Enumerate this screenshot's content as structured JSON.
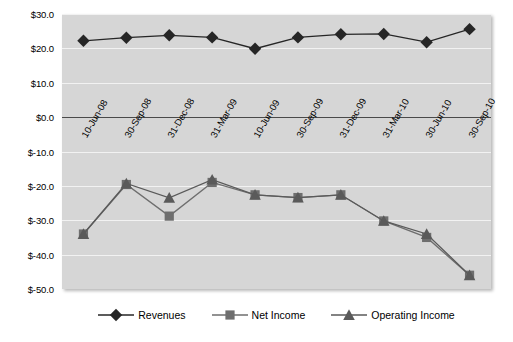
{
  "chart_data": {
    "type": "line",
    "title": "",
    "subtitle": "",
    "xlabel": "",
    "ylabel": "",
    "categories": [
      "10-Jun-08",
      "30-Sep-08",
      "31-Dec-08",
      "31-Mar-09",
      "10-Jun-09",
      "30-Sep-09",
      "31-Dec-09",
      "31-Mar-10",
      "30-Jun-10",
      "30-Sep-10"
    ],
    "ylim": [
      -50.0,
      30.0
    ],
    "ytick_labels": [
      "$30.0",
      "$20.0",
      "$10.0",
      "$0.0",
      "$-10.0",
      "$-20.0",
      "$-30.0",
      "$-40.0",
      "$-50.0"
    ],
    "ytick_values": [
      30,
      20,
      10,
      0,
      -10,
      -20,
      -30,
      -40,
      -50
    ],
    "grid": true,
    "legend_position": "bottom",
    "currency_prefix": "$",
    "series": [
      {
        "name": "Revenues",
        "marker": "diamond",
        "color": "#262626",
        "values": [
          22.2,
          23.1,
          23.8,
          23.2,
          19.9,
          23.2,
          24.1,
          24.2,
          21.8,
          25.6
        ]
      },
      {
        "name": "Net Income",
        "marker": "square",
        "color": "#6e6e6e",
        "values": [
          -34.0,
          -19.6,
          -28.8,
          -19.0,
          -22.6,
          -23.4,
          -22.6,
          -30.2,
          -35.0,
          -46.0
        ]
      },
      {
        "name": "Operating Income",
        "marker": "triangle",
        "color": "#5a5a5a",
        "values": [
          -34.0,
          -19.3,
          -23.5,
          -18.2,
          -22.6,
          -23.4,
          -22.6,
          -30.2,
          -34.0,
          -46.0
        ]
      }
    ]
  },
  "legend": {
    "items": [
      {
        "label": "Revenues",
        "icon": "diamond-marker-icon"
      },
      {
        "label": "Net Income",
        "icon": "square-marker-icon"
      },
      {
        "label": "Operating Income",
        "icon": "triangle-marker-icon"
      }
    ]
  },
  "colors": {
    "plot_background": "#d6d6d6",
    "gridline": "#f2f2f2",
    "zero_axis": "#4a4a4a",
    "revenues": "#262626",
    "net_income": "#6e6e6e",
    "operating_income": "#5a5a5a",
    "page_background": "#ffffff"
  }
}
